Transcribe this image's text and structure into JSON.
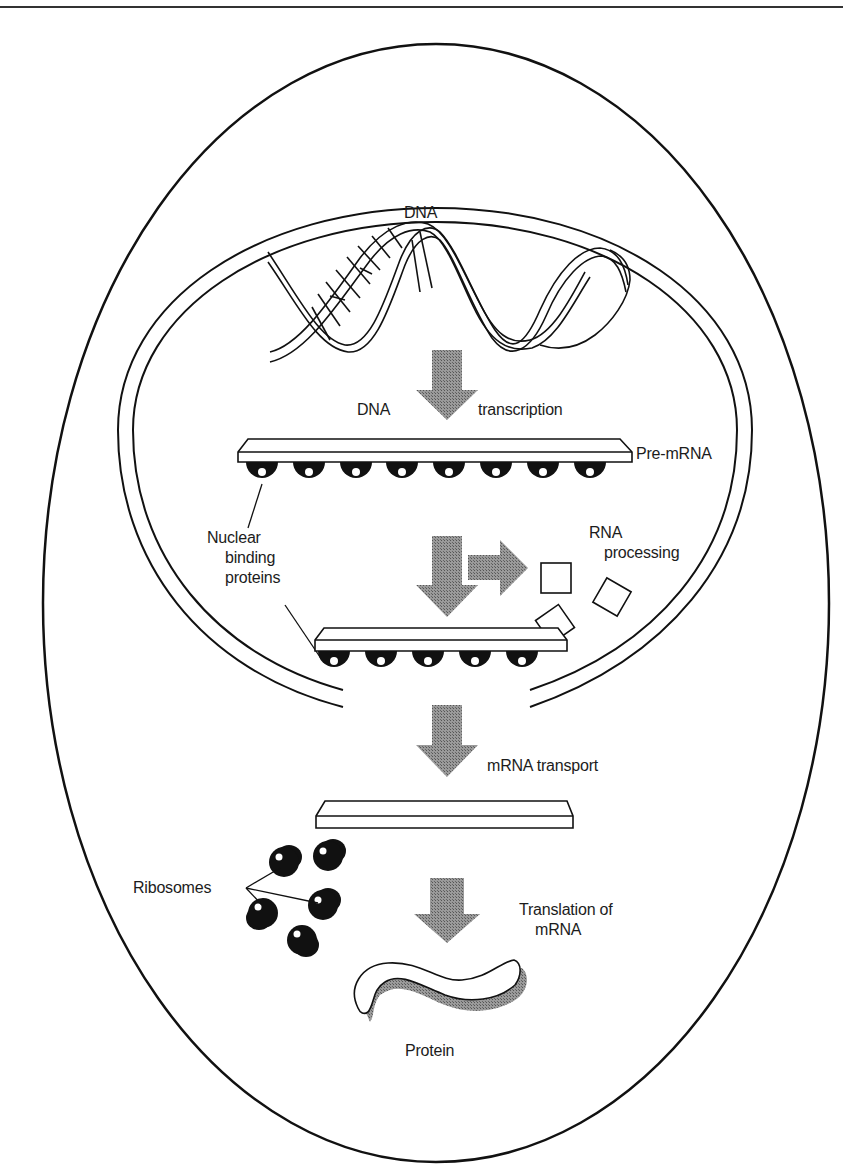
{
  "diagram": {
    "type": "gene-expression-cell-diagram",
    "colors": {
      "stroke": "#111111",
      "arrow_fill": "#8a8a8a",
      "bead_fill": "#111111",
      "background": "#ffffff"
    },
    "labels": {
      "dna_top": "DNA",
      "dna_step": "DNA",
      "transcription": "transcription",
      "pre_mrna": "Pre-mRNA",
      "nuclear_binding_proteins": [
        "Nuclear",
        "binding",
        "proteins"
      ],
      "rna_processing": [
        "RNA",
        "processing"
      ],
      "mrna_transport": "mRNA transport",
      "ribosomes": "Ribosomes",
      "translation": [
        "Translation of",
        "mRNA"
      ],
      "protein": "Protein"
    },
    "steps": [
      {
        "from": "DNA",
        "to": "Pre-mRNA",
        "process": "DNA transcription"
      },
      {
        "from": "Pre-mRNA",
        "to": "mRNA (nuclear)",
        "process": "RNA processing"
      },
      {
        "from": "mRNA (nuclear)",
        "to": "mRNA (cytoplasm)",
        "process": "mRNA transport"
      },
      {
        "from": "mRNA (cytoplasm)",
        "to": "Protein",
        "process": "Translation of mRNA"
      }
    ],
    "counts": {
      "pre_mrna_binding_proteins": 8,
      "processed_mrna_binding_proteins": 5,
      "ribosomes": 5,
      "removed_fragments": 3
    }
  }
}
